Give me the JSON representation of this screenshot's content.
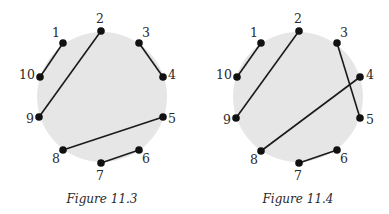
{
  "figures": [
    {
      "caption": "Figure 11.3",
      "circle": {
        "cx": 102,
        "cy": 97,
        "r": 65,
        "fill": "#e6e6e6"
      },
      "points": [
        {
          "label": "1",
          "x": 63,
          "y": 43,
          "lx": 56,
          "ly": 37
        },
        {
          "label": "2",
          "x": 101,
          "y": 31,
          "lx": 100,
          "ly": 23
        },
        {
          "label": "3",
          "x": 139,
          "y": 43,
          "lx": 146,
          "ly": 37
        },
        {
          "label": "4",
          "x": 163,
          "y": 77,
          "lx": 172,
          "ly": 79
        },
        {
          "label": "5",
          "x": 163,
          "y": 117,
          "lx": 172,
          "ly": 123
        },
        {
          "label": "6",
          "x": 139,
          "y": 150,
          "lx": 146,
          "ly": 163
        },
        {
          "label": "7",
          "x": 101,
          "y": 163,
          "lx": 100,
          "ly": 180
        },
        {
          "label": "8",
          "x": 63,
          "y": 150,
          "lx": 56,
          "ly": 163
        },
        {
          "label": "9",
          "x": 39,
          "y": 117,
          "lx": 30,
          "ly": 123
        },
        {
          "label": "10",
          "x": 40,
          "y": 77,
          "lx": 27,
          "ly": 79
        }
      ],
      "chords": [
        [
          "1",
          "10"
        ],
        [
          "2",
          "9"
        ],
        [
          "3",
          "4"
        ],
        [
          "5",
          "8"
        ],
        [
          "6",
          "7"
        ]
      ],
      "caption_x": 102,
      "caption_y": 203
    },
    {
      "caption": "Figure 11.4",
      "circle": {
        "cx": 298,
        "cy": 97,
        "r": 65,
        "fill": "#e6e6e6"
      },
      "points": [
        {
          "label": "1",
          "x": 261,
          "y": 43,
          "lx": 254,
          "ly": 37
        },
        {
          "label": "2",
          "x": 299,
          "y": 31,
          "lx": 298,
          "ly": 23
        },
        {
          "label": "3",
          "x": 337,
          "y": 43,
          "lx": 344,
          "ly": 37
        },
        {
          "label": "4",
          "x": 360,
          "y": 77,
          "lx": 370,
          "ly": 79
        },
        {
          "label": "5",
          "x": 360,
          "y": 118,
          "lx": 370,
          "ly": 124
        },
        {
          "label": "6",
          "x": 337,
          "y": 150,
          "lx": 344,
          "ly": 163
        },
        {
          "label": "7",
          "x": 299,
          "y": 163,
          "lx": 298,
          "ly": 180
        },
        {
          "label": "8",
          "x": 261,
          "y": 151,
          "lx": 254,
          "ly": 164
        },
        {
          "label": "9",
          "x": 236,
          "y": 118,
          "lx": 227,
          "ly": 124
        },
        {
          "label": "10",
          "x": 237,
          "y": 77,
          "lx": 224,
          "ly": 79
        }
      ],
      "chords": [
        [
          "1",
          "10"
        ],
        [
          "2",
          "9"
        ],
        [
          "3",
          "5"
        ],
        [
          "4",
          "8"
        ],
        [
          "6",
          "7"
        ]
      ],
      "caption_x": 298,
      "caption_y": 203
    }
  ],
  "colors": {
    "dot": "#111111",
    "line": "#1a1a1a",
    "disk": "#e6e6e6"
  }
}
